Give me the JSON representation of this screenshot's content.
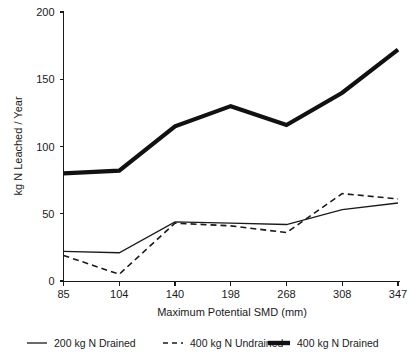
{
  "chart_data": {
    "type": "line",
    "title": "",
    "xlabel": "Maximum Potential SMD (mm)",
    "ylabel": "kg N Leached / Year",
    "categories": [
      "85",
      "104",
      "140",
      "198",
      "268",
      "308",
      "347"
    ],
    "x_tick_labels": [
      "85",
      "104",
      "140",
      "198",
      "268",
      "308",
      "347"
    ],
    "y_tick_labels": [
      "0",
      "50",
      "100",
      "150",
      "200"
    ],
    "y_ticks": [
      0,
      50,
      100,
      150,
      200
    ],
    "ylim": [
      0,
      200
    ],
    "grid": false,
    "legend_position": "bottom",
    "series": [
      {
        "name": "200 kg N Drained",
        "style": "thin-solid",
        "values": [
          22,
          21,
          44,
          43,
          42,
          53,
          58
        ]
      },
      {
        "name": "400 kg N Undrained",
        "style": "dashed",
        "values": [
          19,
          5,
          43,
          41,
          36,
          65,
          61
        ]
      },
      {
        "name": "400 kg N Drained",
        "style": "thick-solid",
        "values": [
          80,
          82,
          115,
          130,
          116,
          140,
          172
        ]
      }
    ]
  },
  "legend": {
    "items": [
      {
        "label": "200 kg N Drained",
        "style": "thin-solid"
      },
      {
        "label": "400 kg N Undrained",
        "style": "dashed"
      },
      {
        "label": "400 kg N Drained",
        "style": "thick-solid"
      }
    ]
  },
  "axes": {
    "x_title": "Maximum Potential SMD (mm)",
    "y_title": "kg N Leached / Year"
  }
}
